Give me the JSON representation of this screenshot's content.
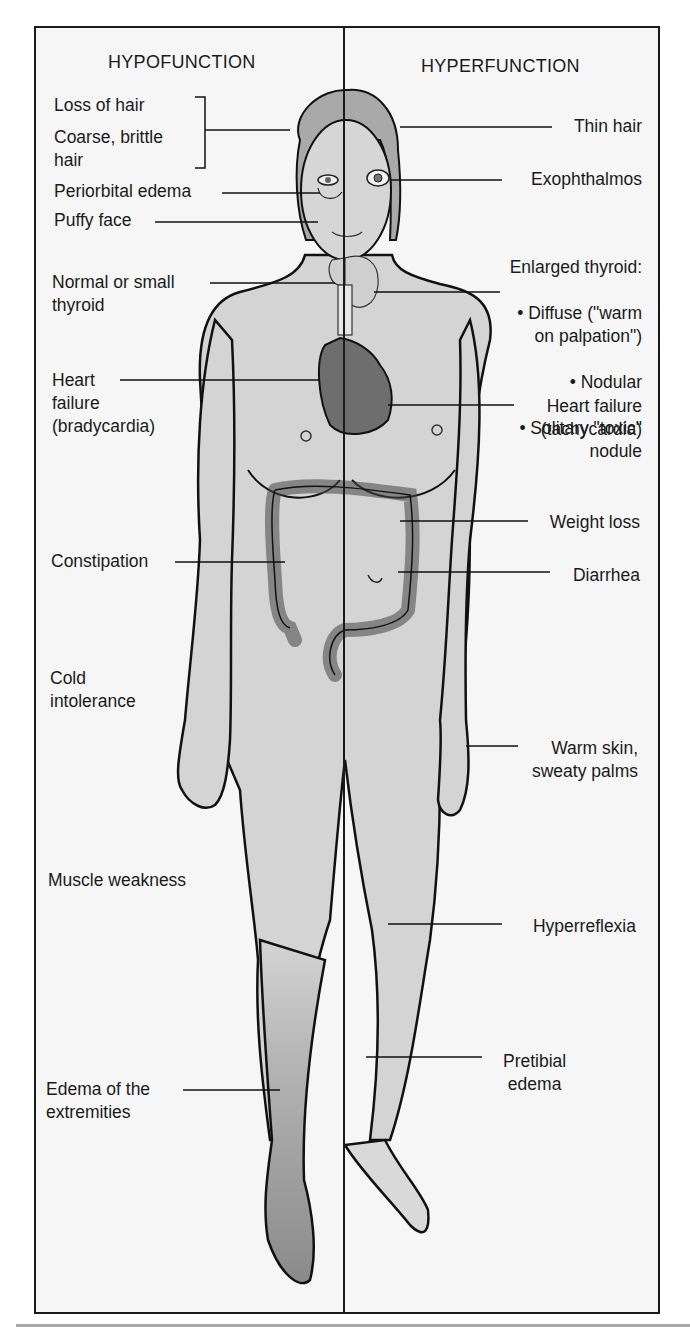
{
  "figure": {
    "columns": {
      "left_heading": "HYPOFUNCTION",
      "right_heading": "HYPERFUNCTION"
    },
    "hypofunction_labels": [
      {
        "id": "loss-of-hair",
        "text": "Loss of hair"
      },
      {
        "id": "coarse-brittle-hair",
        "text": "Coarse, brittle\nhair"
      },
      {
        "id": "periorbital-edema",
        "text": "Periorbital edema"
      },
      {
        "id": "puffy-face",
        "text": "Puffy face"
      },
      {
        "id": "normal-small-thyroid",
        "text": "Normal or small\nthyroid"
      },
      {
        "id": "heart-failure-brady",
        "text": "Heart\nfailure\n(bradycardia)"
      },
      {
        "id": "constipation",
        "text": "Constipation"
      },
      {
        "id": "cold-intolerance",
        "text": "Cold\nintolerance"
      },
      {
        "id": "muscle-weakness",
        "text": "Muscle weakness"
      },
      {
        "id": "edema-extremities",
        "text": "Edema of the\nextremities"
      }
    ],
    "hyperfunction_labels": [
      {
        "id": "thin-hair",
        "text": "Thin hair"
      },
      {
        "id": "exophthalmos",
        "text": "Exophthalmos"
      },
      {
        "id": "enlarged-thyroid",
        "text": "Enlarged thyroid:",
        "bullets": [
          "• Diffuse (\"warm\non palpation\")",
          "• Nodular",
          "• Solitary \"toxic\"\nnodule"
        ]
      },
      {
        "id": "heart-failure-tachy",
        "text": "Heart failure\n(tachycardia)"
      },
      {
        "id": "weight-loss",
        "text": "Weight loss"
      },
      {
        "id": "diarrhea",
        "text": "Diarrhea"
      },
      {
        "id": "warm-skin",
        "text": "Warm skin,\nsweaty palms"
      },
      {
        "id": "hyperreflexia",
        "text": "Hyperreflexia"
      },
      {
        "id": "pretibial-edema",
        "text": "Pretibial\nedema"
      }
    ],
    "colors": {
      "frame": "#1a1a1a",
      "background": "#f6f6f6",
      "skin": "#d4d4d4",
      "hair": "#a9a9a9",
      "heart": "#6e6e6e",
      "edema_leg": "#8c8c8c",
      "bottom_rule": "#a8a8a8"
    }
  }
}
